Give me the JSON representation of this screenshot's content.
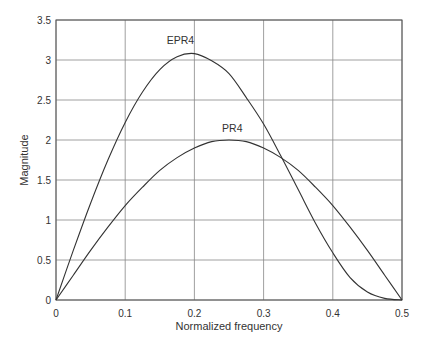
{
  "chart_data": {
    "type": "line",
    "title": "",
    "xlabel": "Normalized frequency",
    "ylabel": "Magnitude",
    "xlim": [
      0,
      0.5
    ],
    "ylim": [
      0,
      3.5
    ],
    "grid": true,
    "x_ticks": [
      "0",
      "0.1",
      "0.2",
      "0.3",
      "0.4",
      "0.5"
    ],
    "y_ticks": [
      "0",
      "0.5",
      "1",
      "1.5",
      "2",
      "2.5",
      "3",
      "3.5"
    ],
    "x": [
      0,
      0.025,
      0.05,
      0.075,
      0.1,
      0.125,
      0.15,
      0.175,
      0.2,
      0.225,
      0.25,
      0.275,
      0.3,
      0.325,
      0.35,
      0.375,
      0.4,
      0.425,
      0.45,
      0.475,
      0.5
    ],
    "series": [
      {
        "name": "EPR4",
        "label_pos": [
          0.16,
          3.2
        ],
        "values": [
          0,
          0.62,
          1.21,
          1.75,
          2.22,
          2.6,
          2.88,
          3.04,
          3.08,
          2.99,
          2.83,
          2.53,
          2.2,
          1.8,
          1.38,
          0.96,
          0.59,
          0.28,
          0.1,
          0.02,
          0
        ]
      },
      {
        "name": "PR4",
        "label_pos": [
          0.24,
          2.1
        ],
        "values": [
          0,
          0.31,
          0.62,
          0.91,
          1.18,
          1.41,
          1.62,
          1.78,
          1.9,
          1.98,
          2.0,
          1.98,
          1.9,
          1.78,
          1.62,
          1.41,
          1.18,
          0.91,
          0.62,
          0.31,
          0
        ]
      }
    ]
  }
}
